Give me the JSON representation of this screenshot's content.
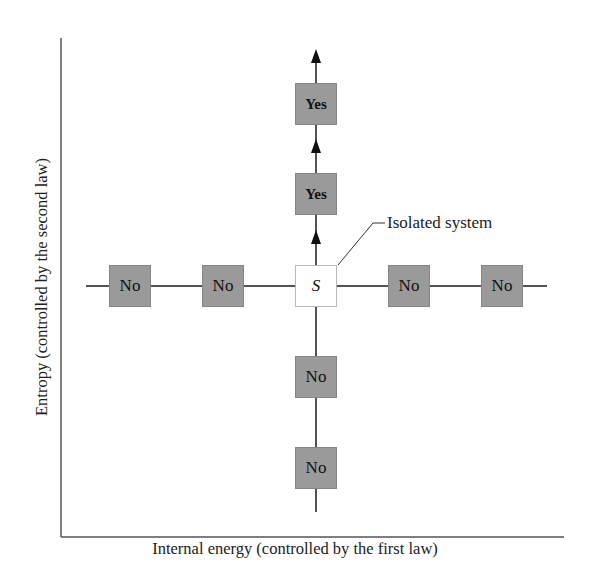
{
  "diagram": {
    "x_axis_label": "Internal energy (controlled by the first law)",
    "y_axis_label": "Entropy (controlled by the second law)",
    "center": {
      "label": "S",
      "callout": "Isolated system"
    },
    "nodes": {
      "up_1": "Yes",
      "up_2": "Yes",
      "left_1": "No",
      "left_2": "No",
      "right_1": "No",
      "right_2": "No",
      "down_1": "No",
      "down_2": "No"
    },
    "colors": {
      "box_fill": "#9a9a9a",
      "line": "#1a1a1a",
      "system_fill": "#ffffff"
    }
  }
}
